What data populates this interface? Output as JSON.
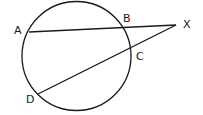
{
  "diagram": {
    "type": "circle-secants",
    "stroke_color": "#1a1a1a",
    "circle": {
      "cx": 76.5,
      "cy": 56,
      "r": 54.5
    },
    "points": {
      "A": {
        "label": "A",
        "x": 29,
        "y": 32,
        "lx": 14,
        "ly": 34
      },
      "B": {
        "label": "B",
        "x": 122,
        "y": 27,
        "lx": 123,
        "ly": 22
      },
      "C": {
        "label": "C",
        "x": 130,
        "y": 49,
        "lx": 136,
        "ly": 60
      },
      "D": {
        "label": "D",
        "x": 38,
        "y": 94,
        "lx": 26,
        "ly": 103
      },
      "X": {
        "label": "X",
        "x": 176,
        "y": 25,
        "lx": 183,
        "ly": 28
      }
    },
    "segments": [
      {
        "from": "A",
        "to": "X"
      },
      {
        "from": "D",
        "to": "X"
      }
    ]
  }
}
